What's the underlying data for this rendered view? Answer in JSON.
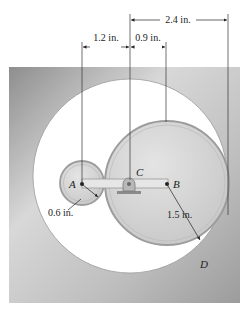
{
  "figure": {
    "dimensions": {
      "top": "2.4 in.",
      "left": "1.2 in.",
      "middle": "0.9 in.",
      "radius_A": "0.6 in.",
      "radius_B": "1.5 in."
    },
    "labels": {
      "A": "A",
      "B": "B",
      "C": "C",
      "D": "D"
    },
    "colors": {
      "housing": "#9a9a9a",
      "housing_light": "#d6d6d6",
      "gear_fill": "#cfcfcf",
      "gear_edge": "#a8a8a8",
      "arm": "#e2e2e2",
      "line": "#333333"
    }
  }
}
